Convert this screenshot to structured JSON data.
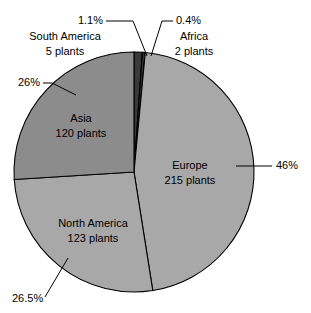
{
  "chart": {
    "type": "pie",
    "title": "",
    "geometry": {
      "center_x": 134,
      "center_y": 172,
      "radius": 120,
      "start_angle_deg": -90,
      "direction": "clockwise"
    }
  },
  "chart_data": {
    "type": "pie",
    "title": "",
    "subtitle": "",
    "xlabel": "",
    "ylabel": "",
    "legend_position": "none",
    "grid": false,
    "unit": "plants",
    "total_plants": 465,
    "categories": [
      "South America",
      "Africa",
      "Europe",
      "North America",
      "Asia"
    ],
    "values": [
      5,
      2,
      215,
      123,
      120
    ],
    "percents": [
      1.1,
      0.4,
      46,
      26.5,
      26
    ],
    "percent_labels": [
      "1.1%",
      "0.4%",
      "46%",
      "26.5%",
      "26%"
    ],
    "value_labels": [
      "5 plants",
      "2 plants",
      "215 plants",
      "123 plants",
      "120 plants"
    ],
    "colors": [
      "#3a3a3a",
      "#2e2e2e",
      "#a8a8a8",
      "#a8a8a8",
      "#8c8c8c"
    ],
    "slices": [
      {
        "name": "South America",
        "value": 5,
        "value_label": "5 plants",
        "percent": 1.1,
        "percent_label": "1.1%",
        "color": "#3a3a3a",
        "label_placement": "outside-left",
        "start_deg": -90,
        "end_deg": -86.04
      },
      {
        "name": "Africa",
        "value": 2,
        "value_label": "2 plants",
        "percent": 0.4,
        "percent_label": "0.4%",
        "color": "#2e2e2e",
        "label_placement": "outside-right",
        "start_deg": -86.04,
        "end_deg": -84.6
      },
      {
        "name": "Europe",
        "value": 215,
        "value_label": "215 plants",
        "percent": 46,
        "percent_label": "46%",
        "color": "#a8a8a8",
        "label_placement": "inside",
        "start_deg": -84.6,
        "end_deg": 81.0
      },
      {
        "name": "North America",
        "value": 123,
        "value_label": "123 plants",
        "percent": 26.5,
        "percent_label": "26.5%",
        "color": "#a8a8a8",
        "label_placement": "inside",
        "start_deg": 81.0,
        "end_deg": 176.4
      },
      {
        "name": "Asia",
        "value": 120,
        "value_label": "120 plants",
        "percent": 26,
        "percent_label": "26%",
        "color": "#8c8c8c",
        "label_placement": "inside",
        "start_deg": 176.4,
        "end_deg": 270.0
      }
    ]
  },
  "labels": {
    "south_america": {
      "percent": "1.1%",
      "name": "South America",
      "plants": "5 plants"
    },
    "africa": {
      "percent": "0.4%",
      "name": "Africa",
      "plants": "2 plants"
    },
    "europe": {
      "percent": "46%",
      "name": "Europe",
      "plants": "215 plants"
    },
    "north_america": {
      "percent": "26.5%",
      "name": "North America",
      "plants": "123 plants"
    },
    "asia": {
      "percent": "26%",
      "name": "Asia",
      "plants": "120 plants"
    }
  }
}
